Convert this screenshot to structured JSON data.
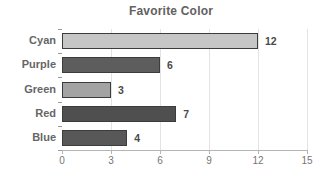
{
  "chart_data": {
    "type": "bar",
    "orientation": "horizontal",
    "title": "Favorite Color",
    "categories": [
      "Cyan",
      "Purple",
      "Green",
      "Red",
      "Blue"
    ],
    "values": [
      12,
      6,
      3,
      7,
      4
    ],
    "xlabel": "",
    "ylabel": "",
    "xlim": [
      0,
      15
    ],
    "x_ticks": [
      0,
      3,
      6,
      9,
      12,
      15
    ],
    "grid": true,
    "legend": "none",
    "value_labels_shown": true,
    "colors": {
      "bar_fills": [
        "#c6c6c6",
        "#5d5d5d",
        "#a3a3a3",
        "#4f4f4f",
        "#585858"
      ],
      "bar_border": "#3c3c3c",
      "title": "#616161",
      "category_label": "#666666",
      "tick_label": "#757575",
      "axis_line": "#b5b5b5",
      "gridline": "#e3e3e3",
      "value_label": "#4a4a4a",
      "background": "#ffffff"
    }
  }
}
